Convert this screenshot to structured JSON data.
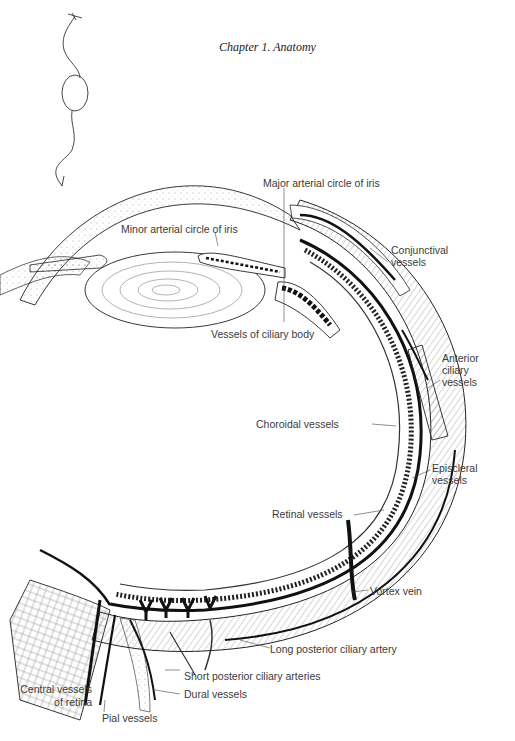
{
  "page": {
    "running_header": "Chapter 1.  Anatomy"
  },
  "diagram": {
    "labels": {
      "major_arterial_circle": "Major arterial circle of iris",
      "minor_arterial_circle": "Minor arterial circle of iris",
      "conjunctival_1": "Conjunctival",
      "conjunctival_2": "vessels",
      "ciliary_body": "Vessels of ciliary body",
      "anterior_ciliary_1": "Anterior",
      "anterior_ciliary_2": "ciliary",
      "anterior_ciliary_3": "vessels",
      "choroidal": "Choroidal vessels",
      "episcleral_1": "Episcleral",
      "episcleral_2": "vessels",
      "retinal": "Retinal vessels",
      "vortex_vein": "Vortex vein",
      "long_posterior_ciliary": "Long posterior ciliary artery",
      "short_posterior_ciliary": "Short posterior ciliary arteries",
      "dural": "Dural vessels",
      "central_retina_1": "Central vessels",
      "central_retina_2": "of retina",
      "pial": "Pial vessels"
    }
  },
  "colors": {
    "ink": "#1a1a1a",
    "label_text": "#3a3a3a",
    "paper": "#ffffff"
  }
}
